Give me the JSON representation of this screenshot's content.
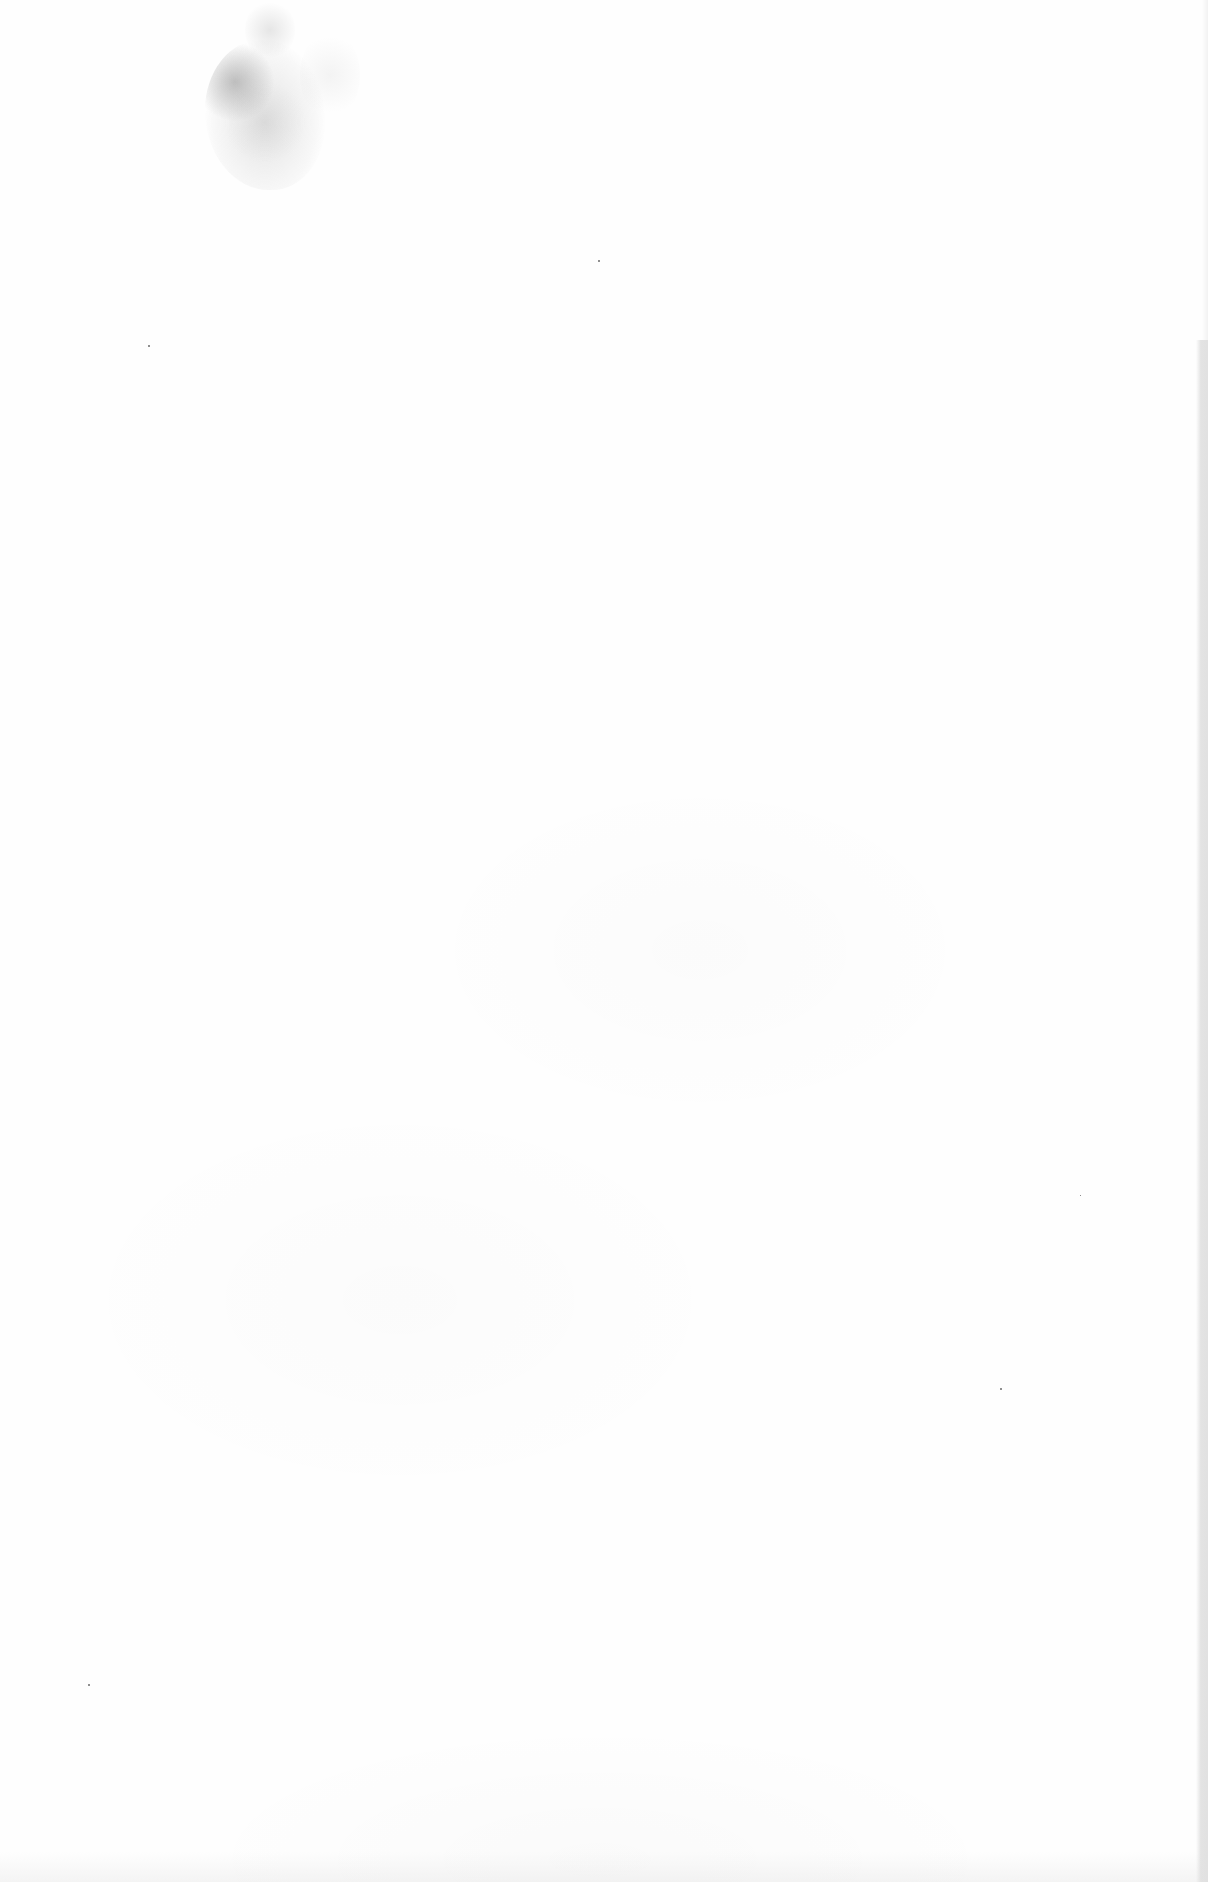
{
  "document": {
    "type": "scanned-page",
    "content": "blank",
    "visible_text": [],
    "background_color": "#fefefe",
    "artifacts": [
      {
        "kind": "smudge",
        "region": "top-left"
      },
      {
        "kind": "edge-shadow",
        "region": "right-edge"
      },
      {
        "kind": "specks",
        "count": 5
      }
    ]
  }
}
